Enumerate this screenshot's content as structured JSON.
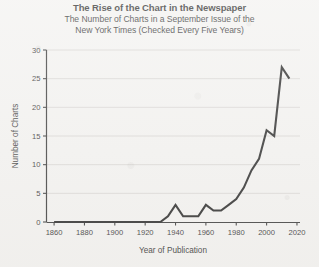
{
  "chart_data": {
    "type": "line",
    "title": "The Rise of the Chart in the Newspaper",
    "subtitle_line1": "The Number of Charts in a September Issue of the",
    "subtitle_line2": "New York Times (Checked Every Five Years)",
    "xlabel": "Year of Publication",
    "ylabel": "Number of Charts",
    "xlim": [
      1855,
      2022
    ],
    "ylim": [
      0,
      30
    ],
    "xticks": [
      1860,
      1880,
      1900,
      1920,
      1940,
      1960,
      1980,
      2000,
      2020
    ],
    "xtick_labels": [
      "1860",
      "1880",
      "1900",
      "1920",
      "1940",
      "1960",
      "1980",
      "2000",
      "2020"
    ],
    "yticks": [
      0,
      5,
      10,
      15,
      20,
      25,
      30
    ],
    "ytick_labels": [
      "0",
      "5",
      "10",
      "15",
      "20",
      "25",
      "30"
    ],
    "grid": "horizontal",
    "legend": "none",
    "line_color": "#111111",
    "background_color": "#f2f1ef",
    "x": [
      1860,
      1865,
      1870,
      1875,
      1880,
      1885,
      1890,
      1895,
      1900,
      1905,
      1910,
      1915,
      1920,
      1925,
      1930,
      1935,
      1940,
      1945,
      1950,
      1955,
      1960,
      1965,
      1970,
      1975,
      1980,
      1985,
      1990,
      1995,
      2000,
      2005,
      2010,
      2015
    ],
    "values": [
      0,
      0,
      0,
      0,
      0,
      0,
      0,
      0,
      0,
      0,
      0,
      0,
      0,
      0,
      0,
      1,
      3,
      1,
      1,
      1,
      3,
      2,
      2,
      3,
      4,
      6,
      9,
      11,
      16,
      15,
      27,
      25
    ]
  },
  "axis": {
    "x_label": "Year of Publication",
    "y_label": "Number of Charts"
  }
}
